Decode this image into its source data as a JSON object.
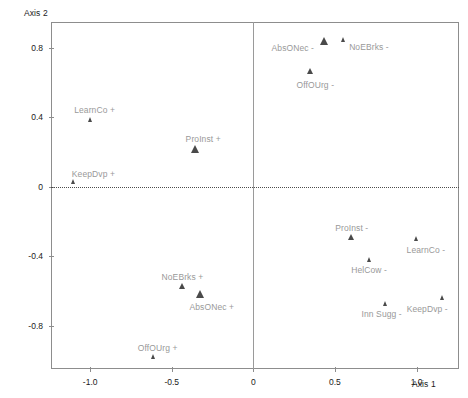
{
  "chart_data": {
    "type": "scatter",
    "title": "",
    "xlabel": "Axis 1",
    "ylabel": "Axis 2",
    "xlim": [
      -1.24,
      1.26
    ],
    "ylim": [
      -1.05,
      0.95
    ],
    "xticks": [
      -1.0,
      -0.5,
      0,
      0.5,
      1.0
    ],
    "xticklabels": [
      "-1.0",
      "-0.5",
      "0",
      "0.5",
      "1.0"
    ],
    "yticks": [
      0.8,
      0.4,
      0,
      -0.4,
      -0.8
    ],
    "yticklabels": [
      "0.8",
      "0.4",
      "0",
      "-0.4",
      "-0.8"
    ],
    "grid": false,
    "legend": "none",
    "marker_shape": "triangle",
    "marker_color": "#4a4a4a",
    "reference_lines": {
      "x": 0,
      "y": 0
    },
    "points": [
      {
        "label": "AbsONec -",
        "x": 0.43,
        "y": 0.84,
        "size": 8,
        "label_dx": -52,
        "label_dy": 2
      },
      {
        "label": "NoEBrks -",
        "x": 0.55,
        "y": 0.85,
        "size": 5,
        "label_dx": 6,
        "label_dy": 3
      },
      {
        "label": "OffOUrg -",
        "x": 0.35,
        "y": 0.67,
        "size": 6,
        "label_dx": -14,
        "label_dy": 9
      },
      {
        "label": "LearnCo +",
        "x": -1.0,
        "y": 0.39,
        "size": 5,
        "label_dx": -16,
        "label_dy": -14
      },
      {
        "label": "ProInst +",
        "x": -0.36,
        "y": 0.22,
        "size": 8,
        "label_dx": -9,
        "label_dy": -15
      },
      {
        "label": "KeepDvp +",
        "x": -1.1,
        "y": 0.03,
        "size": 5,
        "label_dx": -2,
        "label_dy": -13
      },
      {
        "label": "ProInst -",
        "x": 0.6,
        "y": -0.29,
        "size": 6,
        "label_dx": -16,
        "label_dy": -14
      },
      {
        "label": "LearnCo -",
        "x": 1.0,
        "y": -0.3,
        "size": 5,
        "label_dx": -10,
        "label_dy": 6
      },
      {
        "label": "HelCow -",
        "x": 0.71,
        "y": -0.42,
        "size": 5,
        "label_dx": -18,
        "label_dy": 5
      },
      {
        "label": "Inn Sugg -",
        "x": 0.81,
        "y": -0.67,
        "size": 5,
        "label_dx": -24,
        "label_dy": 6
      },
      {
        "label": "KeepDvp -",
        "x": 1.16,
        "y": -0.64,
        "size": 5,
        "label_dx": -36,
        "label_dy": 6
      },
      {
        "label": "NoEBrks +",
        "x": -0.44,
        "y": -0.57,
        "size": 6,
        "label_dx": -20,
        "label_dy": -14
      },
      {
        "label": "AbsONec +",
        "x": -0.33,
        "y": -0.62,
        "size": 8,
        "label_dx": -10,
        "label_dy": 8
      },
      {
        "label": "OffOUrg +",
        "x": -0.61,
        "y": -0.98,
        "size": 5,
        "label_dx": -16,
        "label_dy": -14
      }
    ]
  }
}
